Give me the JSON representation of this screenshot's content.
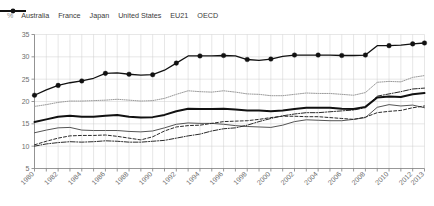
{
  "axis_unit_label": "%",
  "legend": {
    "position": "top",
    "items": [
      {
        "label": "Australia",
        "style": "dashed",
        "color": "#2b2b2b",
        "marker": "none"
      },
      {
        "label": "France",
        "style": "solid",
        "color": "#111111",
        "marker": "circle"
      },
      {
        "label": "Japan",
        "style": "dash-dot",
        "color": "#2b2b2b",
        "marker": "none"
      },
      {
        "label": "United States",
        "style": "solid",
        "color": "#4a4a4a",
        "marker": "none"
      },
      {
        "label": "EU21",
        "style": "dotted",
        "color": "#9a9a9a",
        "marker": "none"
      },
      {
        "label": "OECD",
        "style": "solid-thick",
        "color": "#111111",
        "marker": "none"
      }
    ]
  },
  "chart_data": {
    "type": "line",
    "title": "",
    "subtitle": "",
    "xlabel": "",
    "ylabel": "%",
    "grid": true,
    "xlim": [
      1980,
      2013
    ],
    "ylim": [
      5,
      35
    ],
    "yticks": [
      5,
      10,
      15,
      20,
      25,
      30,
      35
    ],
    "x": [
      1980,
      1981,
      1982,
      1983,
      1984,
      1985,
      1986,
      1987,
      1988,
      1989,
      1990,
      1991,
      1992,
      1993,
      1994,
      1995,
      1996,
      1997,
      1998,
      1999,
      2000,
      2001,
      2002,
      2003,
      2004,
      2005,
      2006,
      2007,
      2008,
      2009,
      2010,
      2011,
      2012,
      2013
    ],
    "xtick_labels": [
      "1980",
      "1982",
      "1984",
      "1986",
      "1988",
      "1990",
      "1992",
      "1994",
      "1996",
      "1998",
      "2000",
      "2002",
      "2004",
      "2006",
      "2008",
      "2010",
      "2012",
      "2013"
    ],
    "series": [
      {
        "name": "France",
        "marker": "circle",
        "values": [
          21.4,
          22.6,
          23.6,
          24.2,
          24.6,
          25.2,
          26.3,
          26.4,
          26.1,
          25.9,
          26.0,
          27.0,
          28.6,
          30.2,
          30.2,
          30.2,
          30.3,
          30.2,
          29.4,
          29.2,
          29.5,
          30.1,
          30.4,
          30.4,
          30.4,
          30.4,
          30.3,
          30.3,
          30.4,
          32.5,
          32.5,
          32.6,
          32.9,
          33.1
        ]
      },
      {
        "name": "EU21",
        "marker": "none",
        "values": [
          18.9,
          19.3,
          19.8,
          20.1,
          20.1,
          20.2,
          20.3,
          20.5,
          20.3,
          20.1,
          20.2,
          20.7,
          21.6,
          22.4,
          22.2,
          22.1,
          22.4,
          22.1,
          21.7,
          21.6,
          21.3,
          21.3,
          21.6,
          21.9,
          21.8,
          21.8,
          21.6,
          21.4,
          22.0,
          24.3,
          24.5,
          24.4,
          25.4,
          25.8
        ]
      },
      {
        "name": "OECD",
        "marker": "none",
        "values": [
          15.4,
          16.0,
          16.6,
          16.8,
          16.6,
          16.6,
          16.8,
          17.0,
          16.6,
          16.4,
          16.5,
          17.0,
          17.8,
          18.4,
          18.3,
          18.3,
          18.4,
          18.2,
          18.0,
          18.0,
          17.8,
          18.0,
          18.3,
          18.6,
          18.6,
          18.6,
          18.4,
          18.3,
          18.8,
          20.9,
          21.1,
          21.0,
          21.6,
          21.9
        ]
      },
      {
        "name": "United States",
        "marker": "none",
        "values": [
          13.0,
          13.6,
          14.1,
          14.2,
          13.6,
          13.5,
          13.5,
          13.5,
          13.3,
          13.2,
          13.4,
          14.1,
          14.9,
          15.2,
          15.1,
          15.1,
          14.9,
          14.6,
          14.4,
          14.3,
          14.2,
          14.7,
          15.5,
          15.9,
          15.8,
          15.7,
          15.7,
          16.0,
          16.4,
          18.7,
          19.3,
          19.0,
          19.2,
          18.6
        ]
      },
      {
        "name": "Australia",
        "marker": "none",
        "values": [
          10.3,
          11.1,
          11.8,
          12.3,
          12.4,
          12.4,
          12.5,
          12.2,
          11.8,
          11.4,
          12.1,
          13.4,
          14.3,
          14.6,
          14.7,
          15.1,
          15.5,
          15.6,
          15.7,
          16.0,
          16.4,
          16.7,
          16.7,
          16.6,
          16.6,
          16.4,
          16.2,
          16.0,
          16.5,
          17.5,
          17.8,
          18.0,
          18.6,
          19.0
        ]
      },
      {
        "name": "Japan",
        "marker": "none",
        "values": [
          10.0,
          10.5,
          10.8,
          11.0,
          10.9,
          11.0,
          11.2,
          11.1,
          10.9,
          10.9,
          11.1,
          11.3,
          11.8,
          12.3,
          12.7,
          13.4,
          13.9,
          14.1,
          14.7,
          15.5,
          16.2,
          16.8,
          17.2,
          17.5,
          17.5,
          17.7,
          17.9,
          18.1,
          18.6,
          21.2,
          21.7,
          22.2,
          22.8,
          23.0
        ]
      }
    ]
  }
}
